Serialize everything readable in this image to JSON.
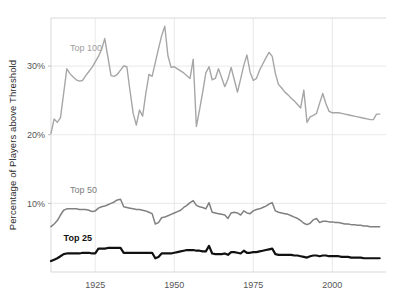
{
  "chart_data": {
    "type": "line",
    "title": "",
    "xlabel": "",
    "ylabel": "Percentage of Players above Threshold",
    "xlim": [
      1911,
      2017
    ],
    "ylim": [
      0,
      37
    ],
    "grid": true,
    "grid_axis": "both",
    "legend_position": "inline-labels",
    "y_tick_labels": [
      "30%",
      "20%",
      "10%"
    ],
    "y_tick_values": [
      30,
      20,
      10
    ],
    "x_tick_labels": [
      "1925",
      "1950",
      "1975",
      "2000"
    ],
    "x_tick_values": [
      1925,
      1950,
      1975,
      2000
    ],
    "x": [
      1911,
      1912,
      1913,
      1914,
      1915,
      1916,
      1917,
      1918,
      1919,
      1920,
      1921,
      1922,
      1923,
      1924,
      1925,
      1926,
      1927,
      1928,
      1929,
      1930,
      1931,
      1932,
      1933,
      1934,
      1935,
      1936,
      1937,
      1938,
      1939,
      1940,
      1941,
      1942,
      1943,
      1944,
      1945,
      1946,
      1947,
      1948,
      1949,
      1950,
      1951,
      1952,
      1953,
      1954,
      1955,
      1956,
      1957,
      1958,
      1959,
      1960,
      1961,
      1962,
      1963,
      1964,
      1965,
      1966,
      1967,
      1968,
      1969,
      1970,
      1971,
      1972,
      1973,
      1974,
      1975,
      1976,
      1977,
      1978,
      1979,
      1980,
      1981,
      1982,
      1983,
      1984,
      1985,
      1986,
      1987,
      1988,
      1989,
      1990,
      1991,
      1992,
      1993,
      1994,
      1995,
      1996,
      1997,
      1998,
      1999,
      2000,
      2001,
      2002,
      2003,
      2004,
      2005,
      2006,
      2007,
      2008,
      2009,
      2010,
      2011,
      2012,
      2013,
      2014,
      2015
    ],
    "series": [
      {
        "name": "Top 100",
        "color": "#a6a6a6",
        "label_x": 1917,
        "label_y": 32.2,
        "values": [
          20.2,
          22.3,
          21.8,
          22.5,
          26.0,
          29.6,
          28.9,
          28.4,
          28.0,
          27.8,
          27.9,
          28.6,
          29.2,
          29.8,
          30.6,
          31.4,
          32.4,
          34.0,
          31.3,
          28.6,
          28.5,
          28.8,
          29.4,
          30.0,
          29.9,
          26.4,
          23.1,
          21.4,
          23.6,
          22.7,
          26.0,
          28.8,
          28.5,
          30.5,
          32.5,
          34.4,
          35.8,
          31.5,
          29.8,
          29.9,
          29.6,
          29.3,
          29.0,
          28.6,
          28.2,
          31.0,
          21.2,
          23.6,
          26.2,
          29.0,
          29.9,
          28.0,
          28.2,
          29.6,
          28.3,
          27.0,
          28.1,
          29.8,
          28.0,
          26.2,
          28.1,
          30.1,
          31.6,
          29.1,
          27.9,
          28.2,
          29.4,
          30.3,
          31.2,
          32.0,
          31.4,
          28.9,
          27.3,
          26.8,
          26.2,
          25.8,
          25.3,
          24.9,
          24.4,
          23.9,
          26.5,
          21.8,
          22.6,
          22.8,
          23.1,
          24.6,
          26.0,
          24.5,
          23.4,
          23.2,
          23.2,
          23.2,
          23.1,
          23.0,
          22.9,
          22.8,
          22.7,
          22.6,
          22.5,
          22.4,
          22.3,
          22.2,
          22.2,
          23.0,
          23.0
        ]
      },
      {
        "name": "Top 50",
        "color": "#808080",
        "label_x": 1917,
        "label_y": 11.5,
        "values": [
          6.6,
          7.0,
          7.5,
          8.3,
          9.0,
          9.2,
          9.2,
          9.2,
          9.2,
          9.1,
          9.1,
          9.1,
          9.0,
          8.8,
          8.9,
          9.3,
          9.5,
          9.6,
          9.8,
          10.0,
          10.2,
          10.5,
          10.6,
          9.5,
          9.4,
          9.3,
          9.2,
          9.1,
          9.1,
          9.0,
          8.9,
          8.7,
          8.5,
          7.0,
          7.2,
          7.9,
          8.0,
          8.2,
          8.4,
          8.6,
          8.8,
          9.0,
          9.4,
          9.7,
          10.1,
          10.4,
          9.7,
          9.5,
          9.4,
          9.2,
          10.1,
          8.7,
          8.6,
          8.5,
          8.4,
          8.3,
          7.8,
          8.6,
          8.7,
          8.6,
          8.3,
          8.9,
          8.6,
          8.5,
          8.9,
          9.1,
          9.2,
          9.4,
          9.6,
          9.9,
          10.1,
          8.9,
          8.7,
          8.6,
          8.5,
          8.4,
          8.2,
          8.0,
          7.8,
          7.5,
          7.1,
          6.9,
          7.1,
          7.6,
          7.8,
          7.2,
          7.4,
          7.4,
          7.3,
          7.3,
          7.2,
          7.2,
          7.1,
          7.0,
          7.0,
          6.9,
          6.9,
          6.8,
          6.8,
          6.7,
          6.7,
          6.6,
          6.6,
          6.6,
          6.6
        ]
      },
      {
        "name": "Top 25",
        "color": "#111111",
        "label_x": 1915,
        "label_y": 4.5,
        "values": [
          1.6,
          1.8,
          2.0,
          2.3,
          2.6,
          2.7,
          2.7,
          2.7,
          2.7,
          2.7,
          2.8,
          2.8,
          2.8,
          2.7,
          2.7,
          3.4,
          3.4,
          3.4,
          3.5,
          3.5,
          3.5,
          3.5,
          3.5,
          2.8,
          2.8,
          2.8,
          2.8,
          2.8,
          2.8,
          2.8,
          2.8,
          2.8,
          2.8,
          2.0,
          2.2,
          2.7,
          2.7,
          2.7,
          2.7,
          2.8,
          2.9,
          3.0,
          3.1,
          3.2,
          3.2,
          3.2,
          3.1,
          3.1,
          3.0,
          3.0,
          3.8,
          2.7,
          2.6,
          2.6,
          2.6,
          2.7,
          2.5,
          2.9,
          2.9,
          2.8,
          2.7,
          3.1,
          2.8,
          2.8,
          2.9,
          2.9,
          3.0,
          3.1,
          3.2,
          3.3,
          3.4,
          2.6,
          2.5,
          2.5,
          2.5,
          2.5,
          2.5,
          2.4,
          2.4,
          2.3,
          2.2,
          2.1,
          2.3,
          2.4,
          2.4,
          2.3,
          2.4,
          2.4,
          2.3,
          2.3,
          2.3,
          2.3,
          2.2,
          2.2,
          2.2,
          2.1,
          2.1,
          2.1,
          2.1,
          2.0,
          2.0,
          2.0,
          2.0,
          2.0,
          2.0
        ]
      }
    ]
  },
  "axes": {
    "y_title": "Percentage of Players above Threshold"
  }
}
